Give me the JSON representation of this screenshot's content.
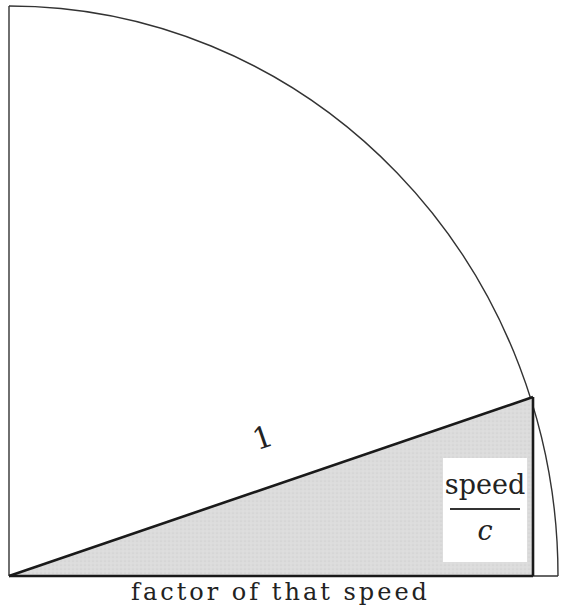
{
  "diagram": {
    "type": "quarter-circle-with-right-triangle",
    "hypotenuse_label": "1",
    "vertical_side_label": {
      "numerator": "speed",
      "denominator": "c"
    },
    "horizontal_side_label": "factor of that speed",
    "colors": {
      "stroke": "#222222",
      "triangle_fill": "#d9d9d9",
      "background": "#ffffff"
    }
  }
}
